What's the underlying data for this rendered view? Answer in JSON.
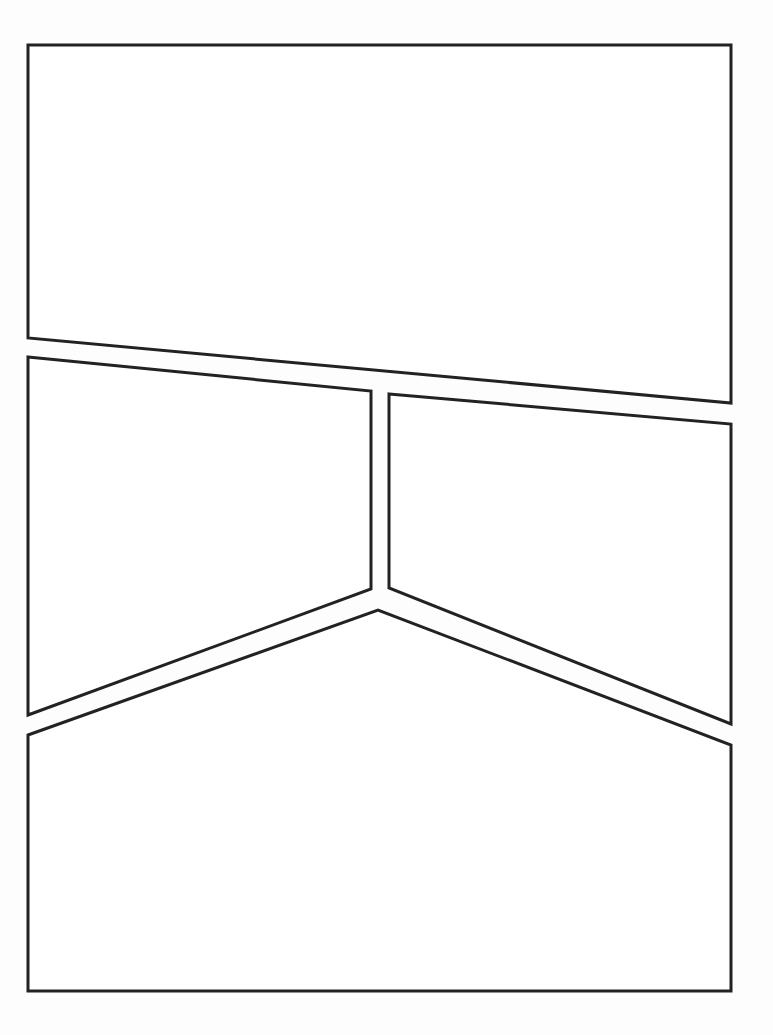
{
  "page": {
    "width": 773,
    "height": 1035,
    "background": "#fdfdfd",
    "border_color": "#222222",
    "panels": [
      {
        "id": "panel-top",
        "points": "28,45 731,45 731,403 28,338"
      },
      {
        "id": "panel-middle-left",
        "points": "28,357 371,391 371,589 28,715"
      },
      {
        "id": "panel-middle-right",
        "points": "389,394 731,424 731,724 389,588"
      },
      {
        "id": "panel-bottom",
        "points": "28,735 378,610 731,745 731,991 28,991"
      }
    ]
  }
}
